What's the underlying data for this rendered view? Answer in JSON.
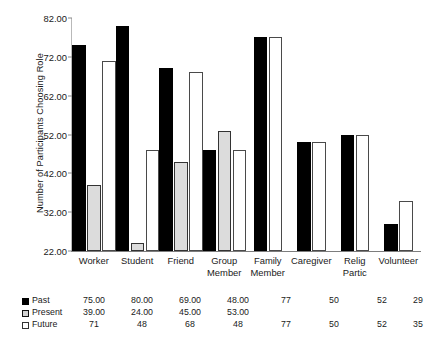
{
  "chart_data": {
    "type": "bar",
    "title": "",
    "xlabel": "",
    "ylabel": "Number of Participants Choosing Role",
    "ylim": [
      22,
      82
    ],
    "yticks": [
      "22.00",
      "32.00",
      "42.00",
      "52.00",
      "62.00",
      "72.00",
      "82.00"
    ],
    "ytick_values": [
      22,
      32,
      42,
      52,
      62,
      72,
      82
    ],
    "grid": false,
    "legend_position": "below-table",
    "categories": [
      "Worker",
      "Student",
      "Friend",
      "Group Member",
      "Family Member",
      "Caregiver",
      "Relig Partic",
      "Volunteer"
    ],
    "category_lines": [
      [
        "Worker"
      ],
      [
        "Student"
      ],
      [
        "Friend"
      ],
      [
        "Group",
        "Member"
      ],
      [
        "Family",
        "Member"
      ],
      [
        "Caregiver"
      ],
      [
        "Relig",
        "Partic"
      ],
      [
        "Volunteer"
      ]
    ],
    "series": [
      {
        "name": "Past",
        "color": "#000000",
        "labels": [
          "75.00",
          "80.00",
          "69.00",
          "48.00",
          "77",
          "50",
          "52",
          "29"
        ],
        "values": [
          75,
          80,
          69,
          48,
          77,
          50,
          52,
          29
        ]
      },
      {
        "name": "Present",
        "color": "#d2d2d2",
        "labels": [
          "39.00",
          "24.00",
          "45.00",
          "53.00",
          "",
          "",
          "",
          ""
        ],
        "values": [
          39,
          24,
          45,
          53,
          null,
          null,
          null,
          null
        ]
      },
      {
        "name": "Future",
        "color": "#ffffff",
        "labels": [
          "71",
          "48",
          "68",
          "48",
          "77",
          "50",
          "52",
          "35"
        ],
        "values": [
          71,
          48,
          68,
          48,
          77,
          50,
          52,
          35
        ]
      }
    ]
  }
}
